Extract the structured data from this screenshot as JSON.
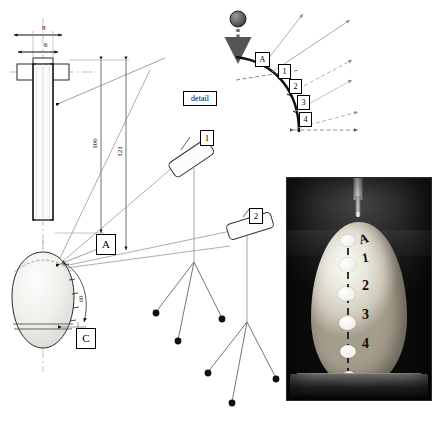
{
  "figure": {
    "detail_label": "detail"
  },
  "dropper": {
    "dim_width_outer": "8",
    "dim_width_inner": "6",
    "dim_height_inner": "100",
    "dim_height_outer": "121",
    "arc_dim": "60"
  },
  "callouts": {
    "impact_point": "A",
    "section_c": "C",
    "camera_1": "1",
    "camera_2": "2"
  },
  "detail_view": {
    "points": [
      "A",
      "1",
      "2",
      "3",
      "4"
    ]
  },
  "photo": {
    "marks": [
      "A",
      "1",
      "2",
      "3",
      "4"
    ]
  },
  "colors": {
    "line": "#1a1a1a",
    "thin_line": "#6f6f6f",
    "specimen_fill": "#f2f2f0",
    "impactor": "#6b6b6b"
  }
}
